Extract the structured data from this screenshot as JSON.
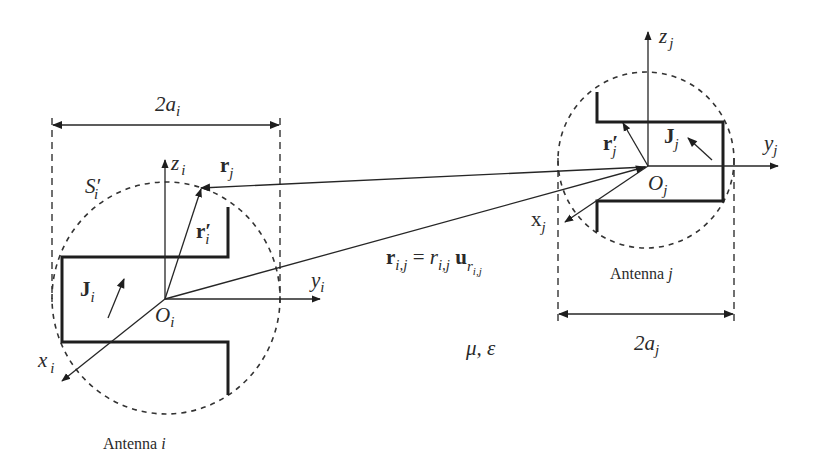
{
  "figure": {
    "medium": {
      "label": "μ, ε"
    },
    "antenna_i": {
      "caption": "Antenna ",
      "caption_index": "i",
      "width": {
        "main": "2a",
        "sub": "i"
      },
      "surface": {
        "main": "S′",
        "sub": "i"
      },
      "current": {
        "main": "J",
        "sub": "i"
      },
      "origin": {
        "main": "O",
        "sub": "i"
      },
      "axis_x": {
        "main": "x",
        "sub": "i"
      },
      "axis_y": {
        "main": "y",
        "sub": "i"
      },
      "axis_z": {
        "main": "z",
        "sub": "i"
      },
      "source_vector": {
        "main": "r′",
        "sub": "i"
      }
    },
    "antenna_j": {
      "caption": "Antenna ",
      "caption_index": "j",
      "width": {
        "main": "2a",
        "sub": "j"
      },
      "current": {
        "main": "J",
        "sub": "j"
      },
      "origin": {
        "main": "O",
        "sub": "j"
      },
      "axis_x": {
        "main": "x",
        "sub": "j"
      },
      "axis_y": {
        "main": "y",
        "sub": "j"
      },
      "axis_z": {
        "main": "z",
        "sub": "j"
      },
      "source_vector": {
        "main": "r′",
        "sub": "j"
      }
    },
    "observation_vector": {
      "main": "r",
      "sub": "j"
    },
    "separation": {
      "lhs": "r",
      "lhs_sub": "i,j",
      "eq": " = ",
      "mag": "r",
      "mag_sub": "i,j",
      "unit": " u",
      "unit_sub": "r",
      "unit_subsub": "i,j"
    }
  },
  "colors": {
    "line": "#262626",
    "background": "#ffffff"
  }
}
